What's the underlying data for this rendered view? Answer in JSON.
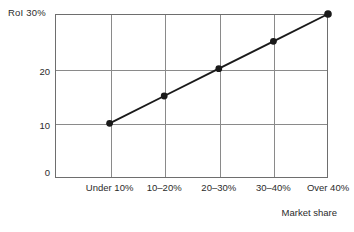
{
  "chart_data": {
    "type": "line",
    "title": "",
    "subtitle": "",
    "xlabel": "Market share",
    "ylabel": "RoI 30%",
    "categories": [
      "Under 10%",
      "10–20%",
      "20–30%",
      "30–40%",
      "Over 40%"
    ],
    "values": [
      10,
      15,
      20,
      25,
      30
    ],
    "series": [
      {
        "name": "RoI",
        "values": [
          10,
          15,
          20,
          25,
          30
        ]
      }
    ],
    "ylim": [
      0,
      30
    ],
    "y_ticks": [
      0,
      10,
      20,
      30
    ],
    "y_tick_labels": [
      "0",
      "10",
      "20",
      "30%"
    ],
    "y_unit": "%",
    "grid": true,
    "grid_x": true,
    "grid_y": true,
    "legend": false,
    "legend_position": "none",
    "markers": "filled-circle",
    "marker_labels": [],
    "annotations": []
  },
  "axes": {
    "y_title_text": "RoI 30%",
    "y_tick_0": "0",
    "y_tick_10": "10",
    "y_tick_20": "20",
    "x_title_text": "Market share",
    "x_label_0": "Under 10%",
    "x_label_1": "10–20%",
    "x_label_2": "20–30%",
    "x_label_3": "30–40%",
    "x_label_4": "Over 40%"
  },
  "style": {
    "background": "#ffffff",
    "grid_color": "#8a8a8a",
    "frame_color": "#6e6e6e",
    "series_color": "#1a1a1a",
    "text_color": "#2b2b2b"
  }
}
